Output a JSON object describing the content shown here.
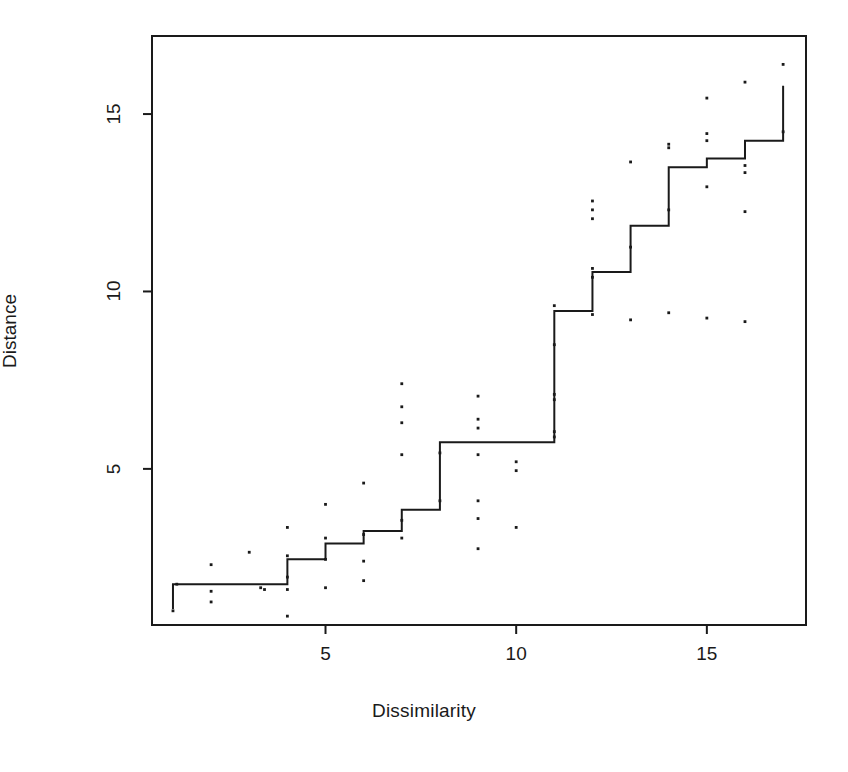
{
  "chart_data": {
    "type": "scatter",
    "title": "",
    "subtitle": "",
    "xlabel": "Dissimilarity",
    "ylabel": "Distance",
    "xlim": [
      0.45,
      17.6
    ],
    "ylim": [
      0.6,
      17.2
    ],
    "xticks": [
      5,
      10,
      15
    ],
    "xtick_labels": [
      "5",
      "10",
      "15"
    ],
    "yticks": [
      5,
      10,
      15
    ],
    "ytick_labels": [
      "5",
      "10",
      "15"
    ],
    "grid": false,
    "legend": null,
    "annotations": [],
    "series": [
      {
        "name": "Isotonic step fit",
        "type": "step",
        "step_mode": "hv",
        "color": "#1a1a1a",
        "x": [
          1,
          2,
          3,
          4,
          5,
          6,
          7,
          8,
          9,
          10,
          11,
          12,
          13,
          14,
          15,
          16,
          17
        ],
        "y": [
          1.75,
          1.75,
          1.75,
          2.45,
          2.9,
          3.25,
          3.85,
          5.75,
          5.75,
          5.75,
          9.45,
          10.55,
          11.85,
          13.5,
          13.75,
          14.25,
          15.8
        ],
        "start_y": 1.05
      },
      {
        "name": "Observed distances",
        "type": "points",
        "color": "#1a1a1a",
        "points": [
          [
            1.0,
            1.0
          ],
          [
            1.1,
            1.75
          ],
          [
            2.0,
            2.3
          ],
          [
            2.0,
            1.55
          ],
          [
            2.0,
            1.25
          ],
          [
            3.0,
            2.65
          ],
          [
            3.3,
            1.65
          ],
          [
            3.4,
            1.6
          ],
          [
            4.0,
            3.35
          ],
          [
            4.0,
            2.55
          ],
          [
            4.0,
            1.95
          ],
          [
            4.0,
            1.6
          ],
          [
            4.0,
            0.85
          ],
          [
            5.0,
            4.0
          ],
          [
            5.0,
            3.05
          ],
          [
            5.0,
            2.45
          ],
          [
            5.0,
            1.65
          ],
          [
            6.0,
            4.6
          ],
          [
            6.0,
            3.15
          ],
          [
            6.0,
            2.4
          ],
          [
            6.0,
            1.85
          ],
          [
            7.0,
            7.4
          ],
          [
            7.0,
            6.75
          ],
          [
            7.0,
            6.3
          ],
          [
            7.0,
            5.4
          ],
          [
            7.0,
            3.55
          ],
          [
            7.0,
            3.05
          ],
          [
            8.0,
            5.45
          ],
          [
            8.0,
            4.1
          ],
          [
            9.0,
            7.05
          ],
          [
            9.0,
            6.4
          ],
          [
            9.0,
            6.15
          ],
          [
            9.0,
            5.4
          ],
          [
            9.0,
            4.1
          ],
          [
            9.0,
            3.6
          ],
          [
            9.0,
            2.75
          ],
          [
            10.0,
            5.2
          ],
          [
            10.0,
            4.95
          ],
          [
            10.0,
            3.35
          ],
          [
            11.0,
            9.6
          ],
          [
            11.0,
            8.5
          ],
          [
            11.0,
            7.1
          ],
          [
            11.0,
            6.95
          ],
          [
            11.0,
            6.05
          ],
          [
            11.0,
            5.9
          ],
          [
            12.0,
            12.55
          ],
          [
            12.0,
            12.3
          ],
          [
            12.0,
            12.05
          ],
          [
            12.0,
            10.65
          ],
          [
            12.0,
            10.4
          ],
          [
            12.0,
            9.35
          ],
          [
            13.0,
            13.65
          ],
          [
            13.0,
            11.25
          ],
          [
            13.0,
            9.2
          ],
          [
            14.0,
            14.15
          ],
          [
            14.0,
            14.05
          ],
          [
            14.0,
            12.3
          ],
          [
            14.0,
            9.4
          ],
          [
            15.0,
            15.45
          ],
          [
            15.0,
            14.45
          ],
          [
            15.0,
            14.25
          ],
          [
            15.0,
            12.95
          ],
          [
            15.0,
            9.25
          ],
          [
            16.0,
            15.9
          ],
          [
            16.0,
            13.55
          ],
          [
            16.0,
            13.35
          ],
          [
            16.0,
            12.25
          ],
          [
            16.0,
            9.15
          ],
          [
            17.0,
            16.4
          ],
          [
            17.0,
            14.5
          ]
        ]
      }
    ]
  },
  "axes": {
    "x_title": "Dissimilarity",
    "y_title": "Distance"
  },
  "ticks": {
    "x": [
      {
        "label": "5",
        "value": 5
      },
      {
        "label": "10",
        "value": 10
      },
      {
        "label": "15",
        "value": 15
      }
    ],
    "y": [
      {
        "label": "5",
        "value": 5
      },
      {
        "label": "10",
        "value": 10
      },
      {
        "label": "15",
        "value": 15
      }
    ]
  },
  "style": {
    "frame_color": "#1a1a1a",
    "line_color": "#1a1a1a",
    "point_color": "#1a1a1a",
    "background": "#ffffff"
  }
}
